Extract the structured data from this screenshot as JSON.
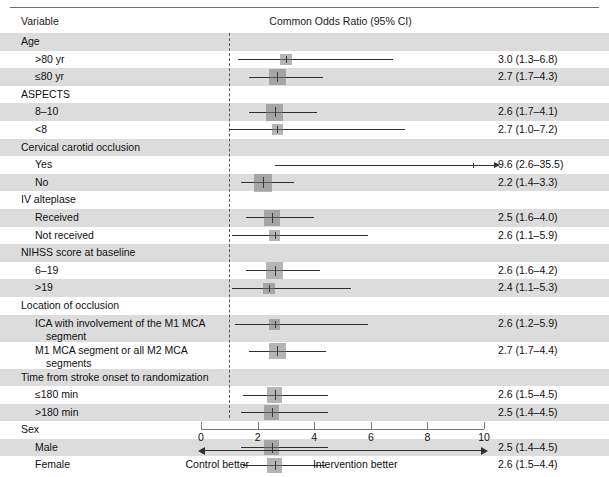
{
  "figure": {
    "header": {
      "variable_label": "Variable",
      "or_label": "Common Odds Ratio (95% CI)"
    },
    "axis": {
      "ticks": [
        "0",
        "2",
        "4",
        "6",
        "8",
        "10"
      ],
      "left_direction_label": "Control better",
      "right_direction_label": "Intervention better"
    }
  },
  "chart_data": {
    "type": "forest",
    "title": "Common Odds Ratio (95% CI)",
    "xlabel": "Common Odds Ratio",
    "ylabel": "Variable",
    "xlim": [
      0,
      10
    ],
    "xticks": [
      0,
      2,
      4,
      6,
      8,
      10
    ],
    "null_value": 1,
    "grid": false,
    "legend": null,
    "annotations": {
      "left": "Control better",
      "right": "Intervention better"
    },
    "rows": [
      {
        "label": "Age",
        "kind": "group",
        "shaded": true
      },
      {
        "label": ">80 yr",
        "kind": "sub",
        "shaded": false,
        "estimate": 3.0,
        "low": 1.3,
        "high": 6.8,
        "text": "3.0 (1.3–6.8)",
        "weight": 0.42
      },
      {
        "label": "≤80 yr",
        "kind": "sub",
        "shaded": true,
        "estimate": 2.7,
        "low": 1.7,
        "high": 4.3,
        "text": "2.7 (1.7–4.3)",
        "weight": 0.86
      },
      {
        "label": "ASPECTS",
        "kind": "group",
        "shaded": false
      },
      {
        "label": "8–10",
        "kind": "sub",
        "shaded": true,
        "estimate": 2.6,
        "low": 1.7,
        "high": 4.1,
        "text": "2.6 (1.7–4.1)",
        "weight": 0.9
      },
      {
        "label": "<8",
        "kind": "sub",
        "shaded": false,
        "estimate": 2.7,
        "low": 1.0,
        "high": 7.2,
        "text": "2.7 (1.0–7.2)",
        "weight": 0.34
      },
      {
        "label": "Cervical carotid occlusion",
        "kind": "group",
        "shaded": true
      },
      {
        "label": "Yes",
        "kind": "sub",
        "shaded": false,
        "estimate": 9.6,
        "low": 2.6,
        "high": 35.5,
        "text": "9.6 (2.6–35.5)",
        "weight": 0.22,
        "clipped_high": true
      },
      {
        "label": "No",
        "kind": "sub",
        "shaded": true,
        "estimate": 2.2,
        "low": 1.4,
        "high": 3.3,
        "text": "2.2 (1.4–3.3)",
        "weight": 1.0
      },
      {
        "label": "IV alteplase",
        "kind": "group",
        "shaded": false
      },
      {
        "label": "Received",
        "kind": "sub",
        "shaded": true,
        "estimate": 2.5,
        "low": 1.6,
        "high": 4.0,
        "text": "2.5 (1.6–4.0)",
        "weight": 0.8
      },
      {
        "label": "Not received",
        "kind": "sub",
        "shaded": false,
        "estimate": 2.6,
        "low": 1.1,
        "high": 5.9,
        "text": "2.6 (1.1–5.9)",
        "weight": 0.36
      },
      {
        "label": "NIHSS score at baseline",
        "kind": "group",
        "shaded": true
      },
      {
        "label": "6–19",
        "kind": "sub",
        "shaded": false,
        "estimate": 2.6,
        "low": 1.6,
        "high": 4.2,
        "text": "2.6 (1.6–4.2)",
        "weight": 0.84
      },
      {
        "label": ">19",
        "kind": "sub",
        "shaded": true,
        "estimate": 2.4,
        "low": 1.1,
        "high": 5.3,
        "text": "2.4 (1.1–5.3)",
        "weight": 0.4
      },
      {
        "label": "Location of occlusion",
        "kind": "group",
        "shaded": false
      },
      {
        "label": "ICA with involvement of the M1 MCA",
        "label_cont": "segment",
        "kind": "wrap",
        "shaded": true,
        "estimate": 2.6,
        "low": 1.2,
        "high": 5.9,
        "text": "2.6 (1.2–5.9)",
        "weight": 0.38
      },
      {
        "label": "M1 MCA segment or all M2 MCA",
        "label_cont": "segments",
        "kind": "wrap",
        "shaded": false,
        "estimate": 2.7,
        "low": 1.7,
        "high": 4.4,
        "text": "2.7 (1.7–4.4)",
        "weight": 0.88
      },
      {
        "label": "Time from stroke onset to randomization",
        "kind": "group",
        "shaded": true
      },
      {
        "label": "≤180 min",
        "kind": "sub",
        "shaded": false,
        "estimate": 2.6,
        "low": 1.5,
        "high": 4.5,
        "text": "2.6 (1.5–4.5)",
        "weight": 0.74
      },
      {
        "label": ">180 min",
        "kind": "sub",
        "shaded": true,
        "estimate": 2.5,
        "low": 1.4,
        "high": 4.5,
        "text": "2.5 (1.4–4.5)",
        "weight": 0.7
      },
      {
        "label": "Sex",
        "kind": "group",
        "shaded": false
      },
      {
        "label": "Male",
        "kind": "sub",
        "shaded": true,
        "estimate": 2.5,
        "low": 1.4,
        "high": 4.5,
        "text": "2.5 (1.4–4.5)",
        "weight": 0.76
      },
      {
        "label": "Female",
        "kind": "sub",
        "shaded": false,
        "estimate": 2.6,
        "low": 1.5,
        "high": 4.4,
        "text": "2.6 (1.5–4.4)",
        "weight": 0.72
      }
    ]
  }
}
